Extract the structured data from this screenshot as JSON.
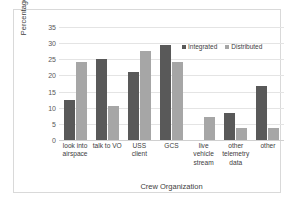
{
  "chart_data": {
    "type": "bar",
    "title": "",
    "xlabel": "Crew Organization",
    "ylabel": "Percentage",
    "ylim": [
      0,
      35
    ],
    "yticks": [
      0,
      5,
      10,
      15,
      20,
      25,
      30,
      35
    ],
    "grid": true,
    "legend_position": "top-right",
    "categories": [
      "look into airspace",
      "talk to VO",
      "USS client",
      "GCS",
      "live vehicle stream",
      "other telemetry data",
      "other"
    ],
    "series": [
      {
        "name": "Integrated",
        "color": "#595959",
        "values": [
          12.4,
          25.1,
          21.0,
          29.3,
          0,
          8.5,
          16.8
        ]
      },
      {
        "name": "Distributed",
        "color": "#a6a6a6",
        "values": [
          24.2,
          10.4,
          27.7,
          24.3,
          7.0,
          3.8,
          3.8
        ]
      }
    ]
  }
}
